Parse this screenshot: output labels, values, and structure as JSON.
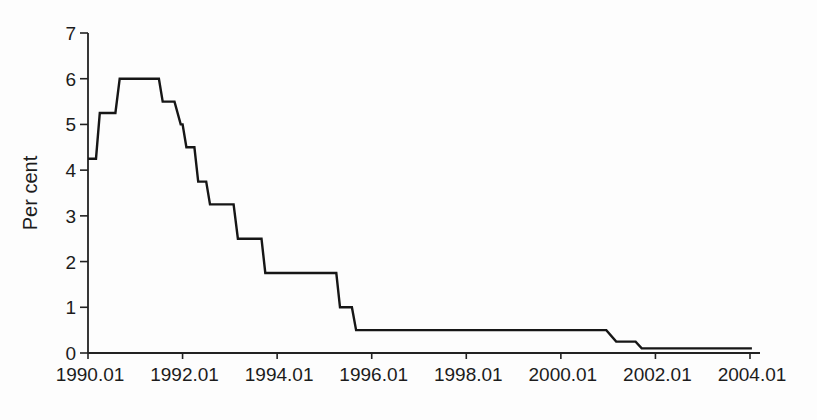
{
  "chart_data": {
    "type": "line",
    "line_style": "step",
    "title": "",
    "xlabel": "",
    "ylabel": "Per cent",
    "grid": false,
    "legend": "none",
    "line_color": "#161616",
    "axis_color": "#222222",
    "xlim": [
      1990.0,
      2004.0
    ],
    "ylim": [
      0,
      7
    ],
    "x_ticks": [
      {
        "value": 1990.0,
        "label": "1990.01"
      },
      {
        "value": 1992.0,
        "label": "1992.01"
      },
      {
        "value": 1994.0,
        "label": "1994.01"
      },
      {
        "value": 1996.0,
        "label": "1996.01"
      },
      {
        "value": 1998.0,
        "label": "1998.01"
      },
      {
        "value": 2000.0,
        "label": "2000.01"
      },
      {
        "value": 2002.0,
        "label": "2002.01"
      },
      {
        "value": 2004.0,
        "label": "2004.01"
      }
    ],
    "y_ticks": [
      {
        "value": 0,
        "label": "0"
      },
      {
        "value": 1,
        "label": "1"
      },
      {
        "value": 2,
        "label": "2"
      },
      {
        "value": 3,
        "label": "3"
      },
      {
        "value": 4,
        "label": "4"
      },
      {
        "value": 5,
        "label": "5"
      },
      {
        "value": 6,
        "label": "6"
      },
      {
        "value": 7,
        "label": "7"
      }
    ],
    "series": [
      {
        "name": "rate",
        "points": [
          [
            1990.0,
            4.25
          ],
          [
            1990.17,
            4.25
          ],
          [
            1990.25,
            5.25
          ],
          [
            1990.58,
            5.25
          ],
          [
            1990.67,
            6.0
          ],
          [
            1991.5,
            6.0
          ],
          [
            1991.58,
            5.5
          ],
          [
            1991.83,
            5.5
          ],
          [
            1991.96,
            5.0
          ],
          [
            1992.0,
            5.0
          ],
          [
            1992.08,
            4.5
          ],
          [
            1992.25,
            4.5
          ],
          [
            1992.33,
            3.75
          ],
          [
            1992.5,
            3.75
          ],
          [
            1992.58,
            3.25
          ],
          [
            1993.08,
            3.25
          ],
          [
            1993.17,
            2.5
          ],
          [
            1993.67,
            2.5
          ],
          [
            1993.75,
            1.75
          ],
          [
            1995.25,
            1.75
          ],
          [
            1995.33,
            1.0
          ],
          [
            1995.58,
            1.0
          ],
          [
            1995.67,
            0.5
          ],
          [
            2000.96,
            0.5
          ],
          [
            2001.17,
            0.25
          ],
          [
            2001.58,
            0.25
          ],
          [
            2001.71,
            0.1
          ],
          [
            2004.04,
            0.1
          ]
        ]
      }
    ]
  }
}
